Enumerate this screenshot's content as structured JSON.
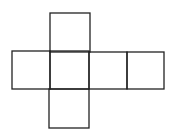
{
  "diagram": {
    "type": "cube-net",
    "stroke_color": "#222222",
    "background": "#ffffff",
    "squares": [
      {
        "name": "top",
        "x": 50,
        "y": 13,
        "w": 40,
        "h": 39
      },
      {
        "name": "left",
        "x": 12,
        "y": 51,
        "w": 38,
        "h": 38
      },
      {
        "name": "center",
        "x": 50,
        "y": 51,
        "w": 39,
        "h": 38
      },
      {
        "name": "right-1",
        "x": 89,
        "y": 52,
        "w": 38,
        "h": 37
      },
      {
        "name": "right-2",
        "x": 127,
        "y": 52,
        "w": 37,
        "h": 37
      },
      {
        "name": "bottom",
        "x": 49,
        "y": 89,
        "w": 40,
        "h": 39
      }
    ]
  }
}
